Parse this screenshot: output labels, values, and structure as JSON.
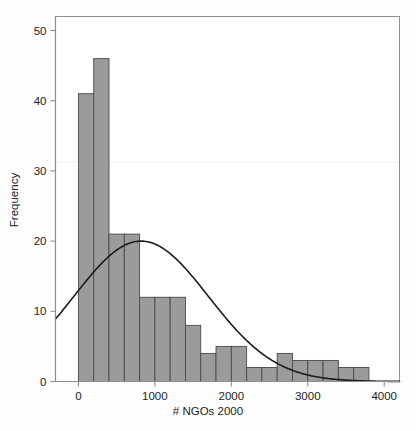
{
  "chart_data": {
    "type": "bar",
    "title": "",
    "subtitle": "",
    "xlabel": "# NGOs 2000",
    "ylabel": "Frequency",
    "xlim": [
      -300,
      4200
    ],
    "ylim": [
      0,
      52
    ],
    "grid": false,
    "legend": null,
    "bin_width": 200,
    "x_ticks": [
      0,
      1000,
      2000,
      3000,
      4000
    ],
    "x_tick_labels": [
      "0",
      "1000",
      "2000",
      "3000",
      "4000"
    ],
    "y_ticks": [
      0,
      10,
      20,
      30,
      40,
      50
    ],
    "y_tick_labels": [
      "0",
      "10",
      "20",
      "30",
      "40",
      "50"
    ],
    "categories": [
      "0-200",
      "200-400",
      "400-600",
      "600-800",
      "800-1000",
      "1000-1200",
      "1200-1400",
      "1400-1600",
      "1600-1800",
      "1800-2000",
      "2000-2200",
      "2200-2400",
      "2400-2600",
      "2600-2800",
      "2800-3000",
      "3000-3200",
      "3200-3400",
      "3400-3600",
      "3600-3800"
    ],
    "bins": [
      {
        "x0": 0,
        "x1": 200,
        "value": 41
      },
      {
        "x0": 200,
        "x1": 400,
        "value": 46
      },
      {
        "x0": 400,
        "x1": 600,
        "value": 21
      },
      {
        "x0": 600,
        "x1": 800,
        "value": 21
      },
      {
        "x0": 800,
        "x1": 1000,
        "value": 12
      },
      {
        "x0": 1000,
        "x1": 1200,
        "value": 12
      },
      {
        "x0": 1200,
        "x1": 1400,
        "value": 12
      },
      {
        "x0": 1400,
        "x1": 1600,
        "value": 8
      },
      {
        "x0": 1600,
        "x1": 1800,
        "value": 4
      },
      {
        "x0": 1800,
        "x1": 2000,
        "value": 5
      },
      {
        "x0": 2000,
        "x1": 2200,
        "value": 5
      },
      {
        "x0": 2200,
        "x1": 2400,
        "value": 2
      },
      {
        "x0": 2400,
        "x1": 2600,
        "value": 2
      },
      {
        "x0": 2600,
        "x1": 2800,
        "value": 4
      },
      {
        "x0": 2800,
        "x1": 3000,
        "value": 3
      },
      {
        "x0": 3000,
        "x1": 3200,
        "value": 3
      },
      {
        "x0": 3200,
        "x1": 3400,
        "value": 3
      },
      {
        "x0": 3400,
        "x1": 3600,
        "value": 2
      },
      {
        "x0": 3600,
        "x1": 3800,
        "value": 2
      }
    ],
    "values": [
      41,
      46,
      21,
      21,
      12,
      12,
      12,
      8,
      4,
      5,
      5,
      2,
      2,
      4,
      3,
      3,
      3,
      2,
      2
    ],
    "overlay_curve": {
      "name": "normal-fit",
      "type": "line",
      "peak_x": 820,
      "peak_y": 20,
      "mean": 820,
      "sigma": 880,
      "amplitude": 20,
      "start_x": -300,
      "start_y": 9,
      "end_x": 4200,
      "end_y": 0.2
    },
    "colors": {
      "bar_fill": "#9b9b9b",
      "bar_edge": "#4a4a4a",
      "curve": "#1c1c1c",
      "axis": "#8e8e8e",
      "text": "#242424",
      "background": "#ffffff"
    }
  },
  "axes": {
    "y_label": "Frequency",
    "x_label": "# NGOs 2000"
  }
}
